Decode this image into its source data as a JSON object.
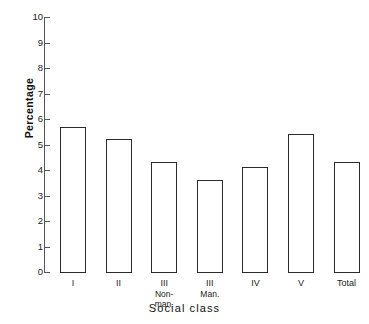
{
  "chart_data": {
    "type": "bar",
    "title": "",
    "xlabel": "Social class",
    "ylabel": "Percentage",
    "categories": [
      "I",
      "II",
      "III",
      "III",
      "IV",
      "V",
      "Total"
    ],
    "category_sublabels": [
      "",
      "",
      "Non-\nman.",
      "Man.",
      "",
      "",
      ""
    ],
    "values": [
      5.7,
      5.2,
      4.3,
      3.6,
      4.1,
      5.4,
      4.3
    ],
    "ylim": [
      0,
      10
    ],
    "ytick_values": [
      "0",
      "1",
      "2",
      "3",
      "4",
      "5",
      "6",
      "7",
      "8",
      "9",
      "10"
    ],
    "grid": false,
    "legend": "none",
    "bar_style": {
      "fill": "#ffffff",
      "stroke": "#2b2b2b"
    }
  },
  "axis": {
    "line_color": "#555555"
  }
}
